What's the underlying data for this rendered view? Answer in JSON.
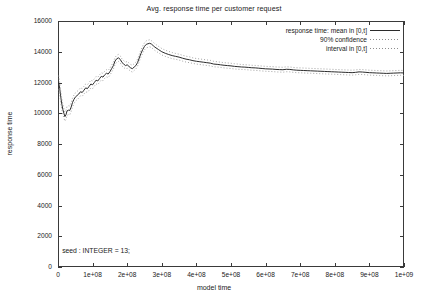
{
  "chart_data": {
    "type": "line",
    "title": "Avg. response time per customer request",
    "xlabel": "model time",
    "ylabel": "response time",
    "xlim": [
      0,
      1000000000
    ],
    "ylim": [
      0,
      16000
    ],
    "grid": false,
    "legend_position": "top-right",
    "xtick_labels": [
      "0",
      "1e+08",
      "2e+08",
      "3e+08",
      "4e+08",
      "5e+08",
      "6e+08",
      "7e+08",
      "8e+08",
      "9e+08",
      "1e+09"
    ],
    "xtick_values": [
      0,
      100000000,
      200000000,
      300000000,
      400000000,
      500000000,
      600000000,
      700000000,
      800000000,
      900000000,
      1000000000
    ],
    "ytick_labels": [
      "0",
      "2000",
      "4000",
      "6000",
      "8000",
      "10000",
      "12000",
      "14000",
      "16000"
    ],
    "ytick_values": [
      0,
      2000,
      4000,
      6000,
      8000,
      10000,
      12000,
      14000,
      16000
    ],
    "annotations": [
      {
        "text": "seed : INTEGER = 13;",
        "x": 12000000,
        "y": 1020
      }
    ],
    "legend": [
      {
        "label": "response time: mean in [0,t]",
        "style": "solid",
        "color": "#2b2b2b"
      },
      {
        "label": "90% confidence",
        "style": "dotted",
        "color": "#8d8d8d"
      },
      {
        "label": "interval in [0,t]",
        "style": "dotted",
        "color": "#8d8d8d"
      }
    ],
    "x": [
      2000000,
      5000000,
      8000000,
      11000000,
      14000000,
      17000000,
      20000000,
      23000000,
      26000000,
      30000000,
      34000000,
      38000000,
      42000000,
      46000000,
      50000000,
      55000000,
      60000000,
      65000000,
      70000000,
      75000000,
      80000000,
      85000000,
      90000000,
      95000000,
      100000000,
      105000000,
      110000000,
      115000000,
      120000000,
      125000000,
      130000000,
      135000000,
      140000000,
      145000000,
      150000000,
      155000000,
      160000000,
      165000000,
      170000000,
      175000000,
      180000000,
      185000000,
      190000000,
      195000000,
      200000000,
      205000000,
      210000000,
      215000000,
      220000000,
      225000000,
      230000000,
      235000000,
      240000000,
      245000000,
      250000000,
      255000000,
      260000000,
      265000000,
      270000000,
      275000000,
      280000000,
      290000000,
      300000000,
      310000000,
      320000000,
      330000000,
      340000000,
      350000000,
      360000000,
      370000000,
      380000000,
      390000000,
      400000000,
      410000000,
      420000000,
      430000000,
      440000000,
      450000000,
      460000000,
      470000000,
      480000000,
      490000000,
      500000000,
      510000000,
      520000000,
      530000000,
      540000000,
      550000000,
      560000000,
      570000000,
      580000000,
      590000000,
      600000000,
      610000000,
      620000000,
      630000000,
      640000000,
      650000000,
      660000000,
      670000000,
      680000000,
      690000000,
      700000000,
      710000000,
      720000000,
      730000000,
      740000000,
      750000000,
      760000000,
      770000000,
      780000000,
      790000000,
      800000000,
      810000000,
      820000000,
      830000000,
      840000000,
      850000000,
      860000000,
      870000000,
      880000000,
      890000000,
      900000000,
      910000000,
      920000000,
      930000000,
      940000000,
      950000000,
      960000000,
      970000000,
      980000000,
      990000000,
      1000000000
    ],
    "series": [
      {
        "name": "response time: mean in [0,t]",
        "style": "solid",
        "values": [
          12000,
          11600,
          11050,
          10600,
          10250,
          10000,
          9780,
          9900,
          10150,
          10200,
          10180,
          10400,
          10700,
          10900,
          11050,
          11150,
          11250,
          11400,
          11350,
          11500,
          11650,
          11600,
          11750,
          11900,
          11850,
          12000,
          12150,
          12100,
          12250,
          12400,
          12350,
          12500,
          12600,
          12550,
          12700,
          12900,
          13100,
          13400,
          13550,
          13600,
          13500,
          13300,
          13200,
          13100,
          13150,
          13050,
          12950,
          12900,
          13000,
          13100,
          13300,
          13600,
          13900,
          14150,
          14350,
          14480,
          14520,
          14550,
          14500,
          14400,
          14300,
          14150,
          14000,
          13900,
          13820,
          13750,
          13700,
          13650,
          13580,
          13520,
          13480,
          13420,
          13380,
          13350,
          13320,
          13290,
          13260,
          13200,
          13180,
          13150,
          13120,
          13100,
          13080,
          13050,
          13030,
          13010,
          13000,
          12980,
          12960,
          12950,
          12930,
          12910,
          12890,
          12880,
          12870,
          12850,
          12840,
          12830,
          12860,
          12850,
          12820,
          12800,
          12790,
          12780,
          12770,
          12760,
          12750,
          12740,
          12730,
          12720,
          12710,
          12700,
          12690,
          12680,
          12670,
          12660,
          12650,
          12640,
          12660,
          12690,
          12680,
          12660,
          12640,
          12630,
          12620,
          12610,
          12600,
          12590,
          12600,
          12610,
          12620,
          12630,
          12620
        ]
      },
      {
        "name": "90% confidence interval upper in [0,t]",
        "style": "dotted",
        "values": [
          12450,
          12000,
          11430,
          10960,
          10580,
          10310,
          10070,
          10190,
          10440,
          10490,
          10470,
          10690,
          10980,
          11180,
          11320,
          11420,
          11510,
          11660,
          11600,
          11750,
          11900,
          11850,
          12000,
          12150,
          12100,
          12240,
          12390,
          12340,
          12490,
          12640,
          12590,
          12730,
          12830,
          12780,
          12930,
          13130,
          13330,
          13630,
          13780,
          13830,
          13730,
          13530,
          13420,
          13320,
          13370,
          13270,
          13170,
          13120,
          13220,
          13320,
          13530,
          13830,
          14130,
          14380,
          14580,
          14710,
          14750,
          14780,
          14720,
          14620,
          14520,
          14360,
          14210,
          14100,
          14020,
          13950,
          13890,
          13840,
          13770,
          13710,
          13670,
          13600,
          13560,
          13530,
          13500,
          13470,
          13440,
          13380,
          13350,
          13320,
          13290,
          13270,
          13250,
          13220,
          13200,
          13170,
          13160,
          13140,
          13120,
          13110,
          13090,
          13070,
          13050,
          13040,
          13030,
          13010,
          13000,
          12990,
          13020,
          13010,
          12980,
          12960,
          12950,
          12940,
          12930,
          12920,
          12910,
          12900,
          12890,
          12880,
          12870,
          12860,
          12850,
          12840,
          12830,
          12820,
          12810,
          12800,
          12820,
          12850,
          12840,
          12820,
          12800,
          12790,
          12780,
          12770,
          12760,
          12750,
          12760,
          12770,
          12780,
          12790,
          12780
        ]
      },
      {
        "name": "90% confidence interval lower in [0,t]",
        "style": "dotted",
        "values": [
          11550,
          11200,
          10670,
          10240,
          9920,
          9690,
          9490,
          9610,
          9860,
          9910,
          9890,
          10110,
          10420,
          10620,
          10780,
          10880,
          10990,
          11140,
          11100,
          11250,
          11400,
          11350,
          11500,
          11650,
          11600,
          11760,
          11910,
          11860,
          12010,
          12160,
          12110,
          12270,
          12370,
          12320,
          12470,
          12670,
          12870,
          13170,
          13320,
          13370,
          13270,
          13070,
          12980,
          12880,
          12930,
          12830,
          12730,
          12680,
          12780,
          12880,
          13070,
          13370,
          13670,
          13920,
          14120,
          14250,
          14290,
          14320,
          14280,
          14180,
          14080,
          13940,
          13790,
          13700,
          13620,
          13550,
          13510,
          13460,
          13390,
          13330,
          13290,
          13240,
          13200,
          13170,
          13140,
          13110,
          13080,
          13020,
          13010,
          12980,
          12950,
          12930,
          12910,
          12880,
          12860,
          12850,
          12840,
          12820,
          12800,
          12790,
          12770,
          12750,
          12730,
          12720,
          12710,
          12690,
          12680,
          12670,
          12700,
          12690,
          12660,
          12640,
          12630,
          12620,
          12610,
          12600,
          12590,
          12580,
          12570,
          12560,
          12550,
          12540,
          12530,
          12520,
          12510,
          12500,
          12490,
          12480,
          12500,
          12530,
          12520,
          12500,
          12480,
          12470,
          12460,
          12450,
          12440,
          12430,
          12440,
          12450,
          12460,
          12470,
          12460
        ]
      }
    ]
  }
}
